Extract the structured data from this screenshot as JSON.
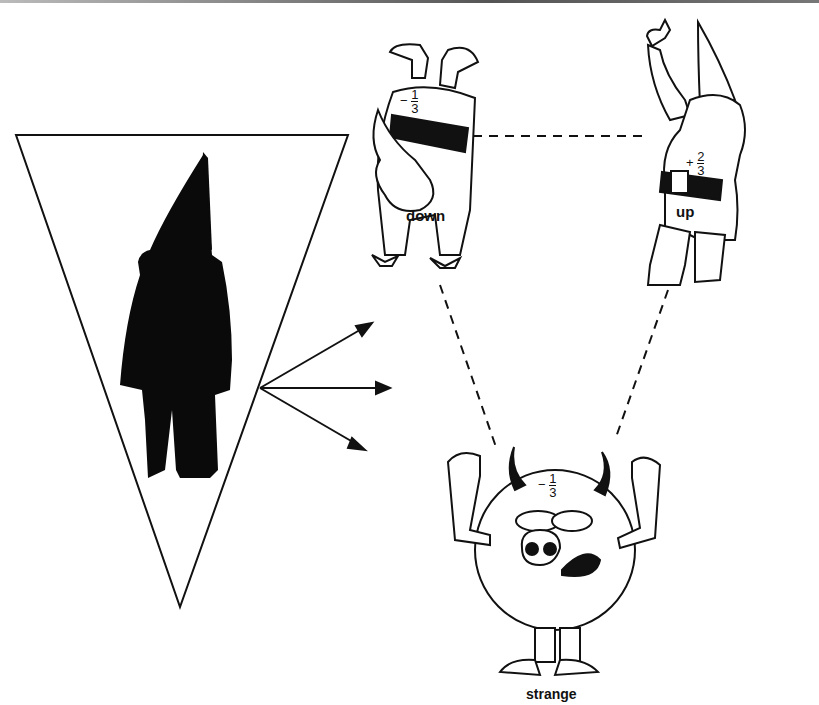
{
  "figure": {
    "type": "quark-diagram",
    "nodes": [
      {
        "id": "down",
        "label": "down",
        "charge": "-1/3",
        "sign": "−",
        "num": "1",
        "den": "3"
      },
      {
        "id": "up",
        "label": "up",
        "charge": "+2/3",
        "sign": "+",
        "num": "2",
        "den": "3"
      },
      {
        "id": "strange",
        "label": "strange",
        "charge": "-1/3",
        "sign": "−",
        "num": "1",
        "den": "3"
      }
    ],
    "edges": [
      {
        "from": "down",
        "to": "up",
        "style": "dashed"
      },
      {
        "from": "down",
        "to": "strange",
        "style": "dashed"
      },
      {
        "from": "up",
        "to": "strange",
        "style": "dashed"
      }
    ],
    "prism": {
      "shape": "inverted-triangle",
      "content": "silhouette-figure",
      "arrows": 3
    }
  },
  "colors": {
    "ink": "#111111",
    "background": "#ffffff"
  }
}
